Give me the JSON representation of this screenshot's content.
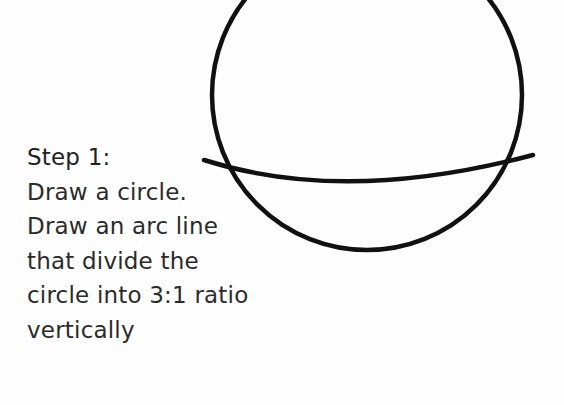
{
  "step": {
    "title": "Step 1:",
    "lines": [
      "Draw a circle.",
      "Draw an arc line",
      "that divide the",
      "circle into 3:1 ratio",
      "vertically"
    ]
  },
  "drawing": {
    "stroke_color": "#111111",
    "circle": {
      "cx": 367,
      "cy": 95,
      "r": 155
    },
    "arc": {
      "start": [
        204,
        160
      ],
      "control": [
        345,
        205
      ],
      "end": [
        533,
        155
      ]
    }
  }
}
